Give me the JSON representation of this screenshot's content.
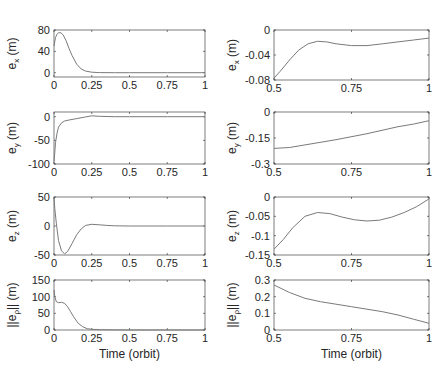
{
  "chart_data": [
    {
      "type": "line",
      "title": "",
      "ylabel_main": "e",
      "ylabel_sub": "x",
      "ylabel_unit": " (m)",
      "xlabel": "",
      "xlim": [
        0,
        1
      ],
      "ylim": [
        -8,
        80
      ],
      "xticks": [
        "0",
        "0.25",
        "0.5",
        "0.75",
        "1"
      ],
      "yticks": [
        "0",
        "40",
        "80"
      ],
      "ytick_vals": [
        0,
        40,
        80
      ],
      "x": [
        0,
        0.01,
        0.02,
        0.03,
        0.045,
        0.06,
        0.08,
        0.1,
        0.12,
        0.15,
        0.18,
        0.21,
        0.25,
        0.3,
        0.4,
        0.5,
        0.75,
        1
      ],
      "values": [
        50,
        66,
        72,
        75,
        75,
        71,
        60,
        45,
        32,
        16,
        7,
        3,
        1,
        0.3,
        0,
        0,
        0,
        0
      ]
    },
    {
      "type": "line",
      "ylabel_main": "e",
      "ylabel_sub": "x",
      "ylabel_unit": " (m)",
      "xlabel": "",
      "xlim": [
        0.5,
        1
      ],
      "ylim": [
        -0.08,
        0
      ],
      "xticks": [
        "0.5",
        "0.75",
        "1"
      ],
      "yticks": [
        "-0.08",
        "-0.04",
        "0"
      ],
      "ytick_vals": [
        -0.08,
        -0.04,
        0
      ],
      "x": [
        0.5,
        0.52,
        0.55,
        0.58,
        0.61,
        0.64,
        0.67,
        0.7,
        0.75,
        0.8,
        0.85,
        0.9,
        0.95,
        1
      ],
      "values": [
        -0.077,
        -0.066,
        -0.048,
        -0.032,
        -0.022,
        -0.018,
        -0.019,
        -0.022,
        -0.025,
        -0.025,
        -0.022,
        -0.019,
        -0.016,
        -0.013
      ]
    },
    {
      "type": "line",
      "ylabel_main": "e",
      "ylabel_sub": "y",
      "ylabel_unit": " (m)",
      "xlabel": "",
      "xlim": [
        0,
        1
      ],
      "ylim": [
        -100,
        10
      ],
      "xticks": [
        "0",
        "0.25",
        "0.5",
        "0.75",
        "1"
      ],
      "yticks": [
        "-100",
        "-50",
        "0"
      ],
      "ytick_vals": [
        -100,
        -50,
        0
      ],
      "x": [
        0,
        0.005,
        0.01,
        0.02,
        0.03,
        0.05,
        0.07,
        0.1,
        0.15,
        0.2,
        0.25,
        0.3,
        0.4,
        0.5,
        0.75,
        1
      ],
      "values": [
        -95,
        -75,
        -55,
        -35,
        -22,
        -13,
        -9,
        -7,
        -4,
        -1,
        2,
        1,
        0,
        0,
        0,
        0
      ]
    },
    {
      "type": "line",
      "ylabel_main": "e",
      "ylabel_sub": "y",
      "ylabel_unit": " (m)",
      "xlabel": "",
      "xlim": [
        0.5,
        1
      ],
      "ylim": [
        -0.3,
        0
      ],
      "xticks": [
        "0.5",
        "0.75",
        "1"
      ],
      "yticks": [
        "-0.3",
        "-0.15",
        "0"
      ],
      "ytick_vals": [
        -0.3,
        -0.15,
        0
      ],
      "x": [
        0.5,
        0.55,
        0.6,
        0.7,
        0.8,
        0.9,
        0.95,
        1
      ],
      "values": [
        -0.21,
        -0.205,
        -0.19,
        -0.16,
        -0.125,
        -0.085,
        -0.07,
        -0.05
      ]
    },
    {
      "type": "line",
      "ylabel_main": "e",
      "ylabel_sub": "z",
      "ylabel_unit": " (m)",
      "xlabel": "",
      "xlim": [
        0,
        1
      ],
      "ylim": [
        -50,
        50
      ],
      "xticks": [
        "0",
        "0.25",
        "0.5",
        "0.75",
        "1"
      ],
      "yticks": [
        "-50",
        "0",
        "50"
      ],
      "ytick_vals": [
        -50,
        0,
        50
      ],
      "x": [
        0,
        0.005,
        0.015,
        0.03,
        0.05,
        0.07,
        0.09,
        0.12,
        0.15,
        0.18,
        0.21,
        0.25,
        0.3,
        0.35,
        0.4,
        0.5,
        0.75,
        1
      ],
      "values": [
        48,
        30,
        5,
        -25,
        -43,
        -48,
        -44,
        -30,
        -15,
        -5,
        1,
        3,
        2,
        1,
        0.3,
        0,
        0,
        0
      ]
    },
    {
      "type": "line",
      "ylabel_main": "e",
      "ylabel_sub": "z",
      "ylabel_unit": " (m)",
      "xlabel": "",
      "xlim": [
        0.5,
        1
      ],
      "ylim": [
        -0.15,
        0
      ],
      "xticks": [
        "0.5",
        "0.75",
        "1"
      ],
      "yticks": [
        "-0.15",
        "-0.1",
        "-0.05",
        "0"
      ],
      "ytick_vals": [
        -0.15,
        -0.1,
        -0.05,
        0
      ],
      "x": [
        0.5,
        0.53,
        0.56,
        0.6,
        0.64,
        0.68,
        0.72,
        0.76,
        0.8,
        0.84,
        0.88,
        0.92,
        0.96,
        1
      ],
      "values": [
        -0.135,
        -0.11,
        -0.08,
        -0.05,
        -0.04,
        -0.043,
        -0.052,
        -0.059,
        -0.062,
        -0.06,
        -0.052,
        -0.04,
        -0.025,
        -0.005
      ]
    },
    {
      "type": "line",
      "ylabel_main": "||e",
      "ylabel_sub": "ρ",
      "ylabel_unit": "|| (m)",
      "xlabel": "Time (orbit)",
      "xlim": [
        0,
        1
      ],
      "ylim": [
        0,
        150
      ],
      "xticks": [
        "0",
        "0.25",
        "0.5",
        "0.75",
        "1"
      ],
      "yticks": [
        "0",
        "50",
        "100",
        "150"
      ],
      "ytick_vals": [
        0,
        50,
        100,
        150
      ],
      "x": [
        0,
        0.005,
        0.015,
        0.03,
        0.05,
        0.07,
        0.09,
        0.11,
        0.13,
        0.16,
        0.19,
        0.22,
        0.25,
        0.3,
        0.4,
        0.5,
        0.75,
        1
      ],
      "values": [
        120,
        100,
        85,
        82,
        83,
        80,
        70,
        55,
        40,
        20,
        10,
        4,
        2,
        0.8,
        0.2,
        0,
        0,
        0
      ]
    },
    {
      "type": "line",
      "ylabel_main": "||e",
      "ylabel_sub": "ρ",
      "ylabel_unit": "|| (m)",
      "xlabel": "Time (orbit)",
      "xlim": [
        0.5,
        1
      ],
      "ylim": [
        0,
        0.3
      ],
      "xticks": [
        "0.5",
        "0.75",
        "1"
      ],
      "yticks": [
        "0",
        "0.1",
        "0.2",
        "0.3"
      ],
      "ytick_vals": [
        0,
        0.1,
        0.2,
        0.3
      ],
      "x": [
        0.5,
        0.55,
        0.6,
        0.65,
        0.7,
        0.75,
        0.8,
        0.85,
        0.9,
        0.95,
        1
      ],
      "values": [
        0.27,
        0.225,
        0.19,
        0.17,
        0.155,
        0.14,
        0.125,
        0.11,
        0.09,
        0.065,
        0.04
      ]
    }
  ],
  "layout": {
    "panels": [
      {
        "x0": 54,
        "x1": 205,
        "y0": 30,
        "y1": 77
      },
      {
        "x0": 274,
        "x1": 429,
        "y0": 30,
        "y1": 80
      },
      {
        "x0": 54,
        "x1": 205,
        "y0": 112,
        "y1": 164
      },
      {
        "x0": 274,
        "x1": 429,
        "y0": 112,
        "y1": 164
      },
      {
        "x0": 54,
        "x1": 205,
        "y0": 197,
        "y1": 255
      },
      {
        "x0": 274,
        "x1": 429,
        "y0": 197,
        "y1": 255
      },
      {
        "x0": 54,
        "x1": 205,
        "y0": 280,
        "y1": 330
      },
      {
        "x0": 274,
        "x1": 429,
        "y0": 280,
        "y1": 330
      }
    ]
  }
}
